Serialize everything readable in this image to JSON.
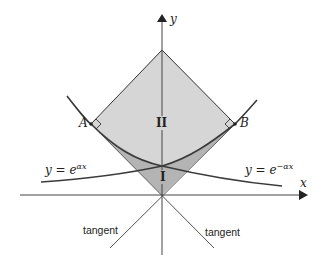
{
  "diagram": {
    "axes": {
      "x_label": "x",
      "y_label": "y"
    },
    "points": {
      "A": "A",
      "B": "B"
    },
    "regions": {
      "upper": "II",
      "lower": "I"
    },
    "curves": {
      "left_label": "y = e",
      "left_exponent": "αx",
      "right_label": "y = e",
      "right_exponent": "−αx"
    },
    "tangents": {
      "left_label": "tangent",
      "right_label": "tangent"
    },
    "colors": {
      "region_upper": "#d6d6d6",
      "region_lower": "#b4b4b4",
      "stroke": "#333333",
      "curve": "#3a3a3a",
      "text": "#222222"
    }
  }
}
